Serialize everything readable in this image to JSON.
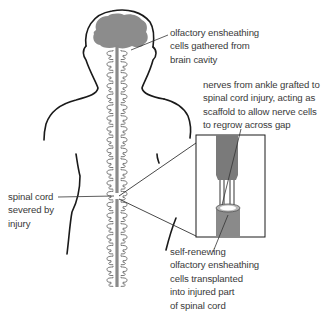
{
  "colors": {
    "outline": "#1a1a1a",
    "brain": "#8c8c8c",
    "cord": "#8a8a8a",
    "text": "#3a3a3a",
    "leader": "#333333"
  },
  "labels": {
    "olfactory_cells": {
      "lines": [
        "olfactory ensheathing",
        "cells gathered from",
        "brain cavity"
      ]
    },
    "nerve_graft": {
      "lines": [
        "nerves from ankle grafted to",
        "spinal cord injury, acting as",
        "scaffold to allow nerve cells",
        "to regrow across gap"
      ]
    },
    "severed_cord": {
      "lines": [
        "spinal cord",
        "severed by",
        "injury"
      ]
    },
    "transplanted_cells": {
      "lines": [
        "self-renewing",
        "olfactory ensheathing",
        "cells transplanted",
        "into injured part",
        "of spinal cord"
      ]
    }
  }
}
